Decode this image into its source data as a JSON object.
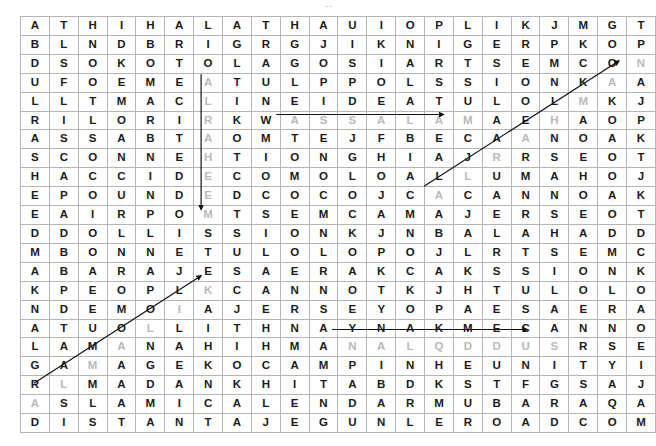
{
  "page": {
    "top_mark": "··"
  },
  "grid": {
    "rows": 23,
    "cols": 22,
    "cell_width": 27.86,
    "cell_height": 17.9,
    "border_color": "#b5b5b5",
    "letter_color": "#1a1a1a",
    "found_letter_color": "#b9b9b9",
    "marker_color": "#111111",
    "letters": [
      [
        "A",
        "T",
        "H",
        "I",
        "H",
        "A",
        "L",
        "A",
        "T",
        "H",
        "A",
        "U",
        "I",
        "O",
        "P",
        "L",
        "I",
        "K",
        "J",
        "M",
        "G",
        "T"
      ],
      [
        "B",
        "L",
        "N",
        "D",
        "B",
        "R",
        "I",
        "G",
        "R",
        "G",
        "J",
        "I",
        "K",
        "N",
        "I",
        "G",
        "E",
        "R",
        "P",
        "K",
        "O",
        "P"
      ],
      [
        "D",
        "S",
        "O",
        "K",
        "O",
        "T",
        "O",
        "L",
        "A",
        "G",
        "O",
        "S",
        "I",
        "A",
        "R",
        "T",
        "S",
        "E",
        "M",
        "C",
        "O",
        "N"
      ],
      [
        "U",
        "F",
        "O",
        "E",
        "M",
        "E",
        "A",
        "T",
        "U",
        "L",
        "P",
        "P",
        "O",
        "L",
        "S",
        "S",
        "I",
        "O",
        "N",
        "K",
        "A",
        "A"
      ],
      [
        "L",
        "L",
        "T",
        "M",
        "A",
        "C",
        "L",
        "I",
        "N",
        "E",
        "I",
        "D",
        "E",
        "A",
        "T",
        "U",
        "L",
        "O",
        "L",
        "M",
        "K",
        "J"
      ],
      [
        "R",
        "I",
        "L",
        "O",
        "R",
        "I",
        "R",
        "K",
        "W",
        "A",
        "S",
        "S",
        "A",
        "L",
        "A",
        "M",
        "A",
        "E",
        "H",
        "A",
        "O",
        "P"
      ],
      [
        "A",
        "S",
        "S",
        "A",
        "B",
        "T",
        "A",
        "O",
        "M",
        "T",
        "E",
        "J",
        "F",
        "B",
        "E",
        "C",
        "A",
        "A",
        "N",
        "O",
        "A",
        "K"
      ],
      [
        "S",
        "C",
        "O",
        "N",
        "N",
        "E",
        "H",
        "T",
        "I",
        "O",
        "N",
        "G",
        "H",
        "I",
        "A",
        "J",
        "R",
        "R",
        "S",
        "E",
        "O",
        "T"
      ],
      [
        "H",
        "A",
        "C",
        "C",
        "I",
        "D",
        "E",
        "C",
        "O",
        "M",
        "O",
        "L",
        "O",
        "A",
        "L",
        "L",
        "U",
        "M",
        "A",
        "H",
        "O",
        "J"
      ],
      [
        "E",
        "P",
        "O",
        "U",
        "N",
        "D",
        "E",
        "D",
        "C",
        "O",
        "C",
        "O",
        "J",
        "C",
        "A",
        "C",
        "A",
        "N",
        "N",
        "O",
        "A",
        "K"
      ],
      [
        "E",
        "A",
        "I",
        "R",
        "P",
        "O",
        "M",
        "T",
        "S",
        "E",
        "M",
        "C",
        "A",
        "M",
        "A",
        "J",
        "E",
        "R",
        "S",
        "E",
        "O",
        "T"
      ],
      [
        "D",
        "D",
        "O",
        "L",
        "L",
        "I",
        "S",
        "S",
        "I",
        "O",
        "N",
        "K",
        "J",
        "N",
        "B",
        "A",
        "L",
        "A",
        "H",
        "A",
        "D",
        "D"
      ],
      [
        "M",
        "B",
        "O",
        "N",
        "N",
        "E",
        "T",
        "U",
        "L",
        "O",
        "L",
        "O",
        "P",
        "O",
        "J",
        "L",
        "R",
        "T",
        "S",
        "E",
        "M",
        "C"
      ],
      [
        "A",
        "B",
        "A",
        "R",
        "A",
        "J",
        "E",
        "S",
        "A",
        "E",
        "R",
        "A",
        "K",
        "C",
        "A",
        "K",
        "S",
        "S",
        "I",
        "O",
        "N",
        "K"
      ],
      [
        "K",
        "P",
        "E",
        "O",
        "P",
        "L",
        "K",
        "C",
        "A",
        "N",
        "N",
        "O",
        "T",
        "K",
        "J",
        "H",
        "T",
        "U",
        "L",
        "O",
        "L",
        "O"
      ],
      [
        "N",
        "D",
        "E",
        "M",
        "O",
        "I",
        "A",
        "J",
        "E",
        "R",
        "S",
        "E",
        "Y",
        "O",
        "P",
        "A",
        "E",
        "S",
        "A",
        "E",
        "R",
        "A"
      ],
      [
        "A",
        "T",
        "U",
        "O",
        "L",
        "L",
        "I",
        "T",
        "H",
        "N",
        "A",
        "Y",
        "N",
        "A",
        "K",
        "M",
        "E",
        "C",
        "A",
        "N",
        "N",
        "O"
      ],
      [
        "L",
        "A",
        "M",
        "A",
        "N",
        "A",
        "H",
        "I",
        "H",
        "M",
        "A",
        "N",
        "A",
        "L",
        "Q",
        "D",
        "D",
        "U",
        "S",
        "R",
        "S",
        "E"
      ],
      [
        "G",
        "A",
        "M",
        "A",
        "G",
        "E",
        "K",
        "O",
        "C",
        "A",
        "M",
        "P",
        "I",
        "N",
        "H",
        "E",
        "U",
        "N",
        "I",
        "T",
        "Y",
        "I"
      ],
      [
        "R",
        "L",
        "M",
        "A",
        "D",
        "A",
        "N",
        "K",
        "H",
        "I",
        "T",
        "A",
        "B",
        "D",
        "K",
        "S",
        "T",
        "F",
        "G",
        "S",
        "A",
        "J"
      ],
      [
        "A",
        "S",
        "L",
        "A",
        "M",
        "I",
        "C",
        "A",
        "L",
        "E",
        "N",
        "D",
        "A",
        "R",
        "M",
        "U",
        "B",
        "A",
        "R",
        "A",
        "Q",
        "A"
      ],
      [
        "D",
        "I",
        "S",
        "T",
        "A",
        "N",
        "T",
        "A",
        "J",
        "E",
        "G",
        "U",
        "N",
        "L",
        "E",
        "R",
        "O",
        "A",
        "D",
        "C",
        "O",
        "M"
      ]
    ],
    "found_cells": [
      [
        3,
        6
      ],
      [
        4,
        6
      ],
      [
        5,
        6
      ],
      [
        6,
        6
      ],
      [
        7,
        6
      ],
      [
        8,
        6
      ],
      [
        9,
        6
      ],
      [
        10,
        6
      ],
      [
        5,
        9
      ],
      [
        5,
        10
      ],
      [
        5,
        11
      ],
      [
        5,
        12
      ],
      [
        5,
        13
      ],
      [
        5,
        14
      ],
      [
        5,
        15
      ],
      [
        17,
        11
      ],
      [
        17,
        12
      ],
      [
        17,
        13
      ],
      [
        17,
        14
      ],
      [
        17,
        15
      ],
      [
        17,
        16
      ],
      [
        17,
        17
      ],
      [
        17,
        18
      ],
      [
        2,
        21
      ],
      [
        3,
        20
      ],
      [
        4,
        19
      ],
      [
        5,
        18
      ],
      [
        6,
        17
      ],
      [
        7,
        16
      ],
      [
        8,
        15
      ],
      [
        9,
        14
      ],
      [
        14,
        6
      ],
      [
        15,
        5
      ],
      [
        16,
        4
      ],
      [
        17,
        3
      ],
      [
        18,
        2
      ],
      [
        19,
        1
      ],
      [
        20,
        0
      ]
    ],
    "markers": [
      {
        "name": "assalam-horizontal-arrow",
        "word": "ASSALAM",
        "type": "horizontal",
        "row": 5,
        "col_start": 9,
        "col_end": 15
      },
      {
        "name": "alraheem-vertical-arrow",
        "word": "ALRAHEEM",
        "type": "vertical",
        "col": 6,
        "row_start": 3,
        "row_end": 10
      },
      {
        "name": "alquddus-horizontal-arrow",
        "word": "ALQDDUS",
        "type": "horizontal",
        "row": 17,
        "col_start": 11,
        "col_end": 18
      },
      {
        "name": "short-diagonal-arrow",
        "word": "ALBAHMN",
        "type": "diagonal",
        "row_start": 9,
        "col_start": 14,
        "row_end": 2,
        "col_end": 21
      },
      {
        "name": "long-diagonal-arrow",
        "word": "ALMALK",
        "type": "diagonal",
        "row_start": 20,
        "col_start": 0,
        "row_end": 14,
        "col_end": 6
      }
    ]
  }
}
